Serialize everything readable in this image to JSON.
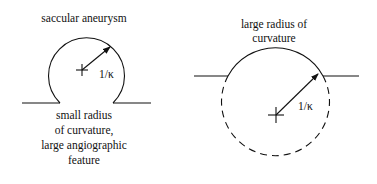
{
  "left_panel": {
    "title": "saccular aneurysm",
    "radius_label": "1/κ",
    "caption": [
      "small radius",
      "of curvature,",
      "large angiographic",
      "feature"
    ]
  },
  "right_panel": {
    "title": [
      "large radius of",
      "curvature"
    ],
    "radius_label": "1/κ"
  },
  "colors": {
    "line": "#111111",
    "background": "#ffffff"
  }
}
